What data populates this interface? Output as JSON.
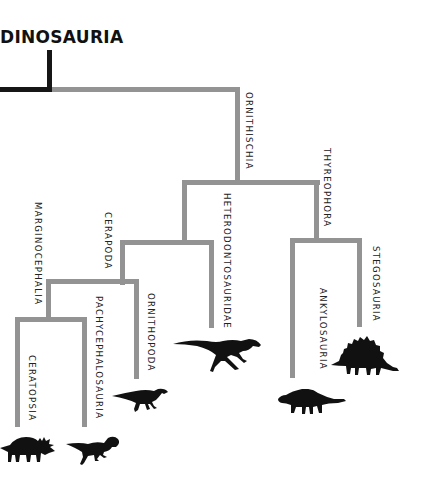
{
  "title": "DINOSAURIA",
  "colors": {
    "background": "#ffffff",
    "root_line": "#161616",
    "branch_line": "#939393",
    "text": "#222222",
    "silhouette": "#111111"
  },
  "tree": {
    "root": "Dinosauria",
    "clades": [
      {
        "id": "ornithischia",
        "label": "ORNITHISCHIA",
        "parent": "dinosauria"
      },
      {
        "id": "thyreophora",
        "label": "THYREOPHORA",
        "parent": "ornithischia"
      },
      {
        "id": "heterodontosauridae",
        "label": "HETERODONTOSAURIDAE",
        "parent": "ornithischia"
      },
      {
        "id": "cerapoda",
        "label": "CERAPODA",
        "parent": "ornithischia"
      },
      {
        "id": "marginocephalia",
        "label": "MARGINOCEPHALIA",
        "parent": "cerapoda"
      },
      {
        "id": "ornithopoda",
        "label": "ORNITHOPODA",
        "parent": "cerapoda"
      },
      {
        "id": "ceratopsia",
        "label": "CERATOPSIA",
        "parent": "marginocephalia"
      },
      {
        "id": "pachycephalosauria",
        "label": "PACHYCEPHALOSAURIA",
        "parent": "marginocephalia"
      },
      {
        "id": "ankylosauria",
        "label": "ANKYLOSAURIA",
        "parent": "thyreophora"
      },
      {
        "id": "stegosauria",
        "label": "STEGOSAURIA",
        "parent": "thyreophora"
      }
    ]
  },
  "labels": {
    "ornithischia": "ORNITHISCHIA",
    "thyreophora": "THYREOPHORA",
    "heterodontosauridae": "HETERODONTOSAURIDAE",
    "cerapoda": "CERAPODA",
    "marginocephalia": "MARGINOCEPHALIA",
    "ornithopoda": "ORNITHOPODA",
    "ceratopsia": "CERATOPSIA",
    "pachycephalosauria": "PACHYCEPHALOSAURIA",
    "ankylosauria": "ANKYLOSAURIA",
    "stegosauria": "STEGOSAURIA"
  },
  "silhouettes": [
    {
      "name": "triceratops-silhouette",
      "clade": "ceratopsia"
    },
    {
      "name": "pachycephalosaurus-silhouette",
      "clade": "pachycephalosauria"
    },
    {
      "name": "hadrosaur-silhouette",
      "clade": "ornithopoda"
    },
    {
      "name": "heterodontosaurus-silhouette",
      "clade": "heterodontosauridae"
    },
    {
      "name": "ankylosaurus-silhouette",
      "clade": "ankylosauria"
    },
    {
      "name": "stegosaurus-silhouette",
      "clade": "stegosauria"
    }
  ]
}
